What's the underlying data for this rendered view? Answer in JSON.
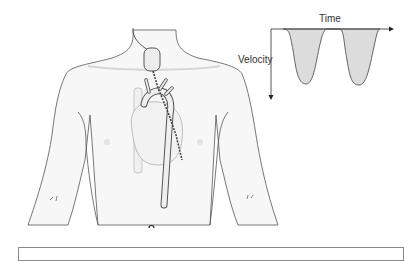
{
  "figure": {
    "labels": {
      "time_axis": "Time",
      "velocity_axis": "Velocity"
    },
    "colors": {
      "outline": "#555555",
      "skin_fill": "#f7f7f7",
      "waveform_fill": "#dcdcdc",
      "organ_fill": "#f0f0f0",
      "caption_border": "#8a8a8a"
    }
  },
  "inset_waveform": {
    "x_axis": "Time",
    "y_axis": "Velocity",
    "y_direction": "downward",
    "pulses": 2
  },
  "caption_box": {
    "text": ""
  }
}
